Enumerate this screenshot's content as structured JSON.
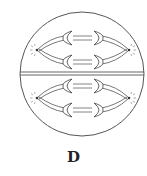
{
  "figure": {
    "label": "D",
    "colors": {
      "stroke": "#555555",
      "background": "#ffffff",
      "label": "#222222"
    }
  },
  "cells": [
    {
      "name": "upper-cell",
      "poles": [
        "left",
        "right"
      ],
      "chromosome_pairs": 2
    },
    {
      "name": "lower-cell",
      "poles": [
        "left",
        "right"
      ],
      "chromosome_pairs": 2
    }
  ]
}
